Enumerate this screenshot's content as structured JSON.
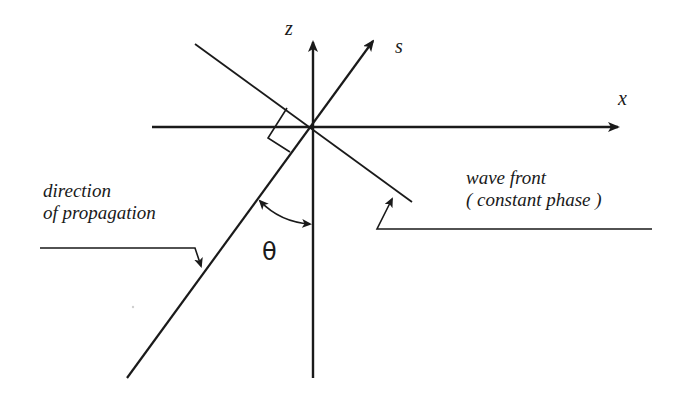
{
  "diagram": {
    "axes": {
      "z_label": "z",
      "s_label": "s",
      "x_label": "x"
    },
    "angle_label": "θ",
    "annotations": {
      "direction_line1": "direction",
      "direction_line2": "of propagation",
      "wavefront_line1": "wave front",
      "wavefront_line2": "( constant phase )"
    },
    "colors": {
      "stroke": "#1a1a1a",
      "background": "#ffffff"
    }
  }
}
